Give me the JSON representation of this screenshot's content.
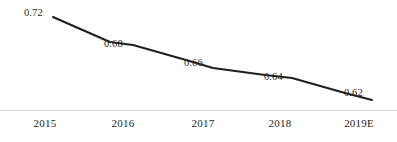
{
  "chart_data": {
    "type": "line",
    "title": "",
    "subtitle": "",
    "xlabel": "",
    "ylabel": "",
    "categories": [
      "2015",
      "2016",
      "2017",
      "2018",
      "2019E"
    ],
    "values": [
      0.72,
      0.68,
      0.66,
      0.64,
      0.62
    ],
    "value_labels": [
      "0.72",
      "0.68",
      "0.66",
      "0.64",
      "0.62"
    ],
    "series": [
      {
        "name": "",
        "values": [
          0.72,
          0.68,
          0.66,
          0.64,
          0.62
        ]
      }
    ],
    "ylim": [
      0.6,
      0.73
    ],
    "grid": false,
    "legend": false,
    "legend_position": "none",
    "markers": false,
    "annotations": [],
    "colors": {
      "line": "#1f1f1f",
      "axis": "#d9d9d9",
      "text": "#1f1f1f",
      "background": "#ffffff"
    }
  },
  "axis": {
    "x_axis_name": "x-axis-line"
  },
  "points": [
    {
      "category": "2015",
      "value_label": "0.72",
      "px": 53,
      "py": 17,
      "label_x": 24,
      "label_y": 8,
      "cat_x": 45
    },
    {
      "category": "2016",
      "value_label": "0.68",
      "px": 133,
      "py": 45,
      "label_x": 104,
      "label_y": 39,
      "cat_x": 123
    },
    {
      "category": "2017",
      "value_label": "0.66",
      "px": 213,
      "py": 68,
      "label_x": 184,
      "label_y": 58,
      "cat_x": 203
    },
    {
      "category": "2018",
      "value_label": "0.64",
      "px": 292,
      "py": 78,
      "label_x": 264,
      "label_y": 72,
      "cat_x": 280
    },
    {
      "category": "2019E",
      "value_label": "0.62",
      "px": 372,
      "py": 100,
      "label_x": 344,
      "label_y": 88,
      "cat_x": 359
    }
  ],
  "polyline": "53,17 110,42 133,45 186,60 213,68 265,75 292,78 345,93 372,100"
}
